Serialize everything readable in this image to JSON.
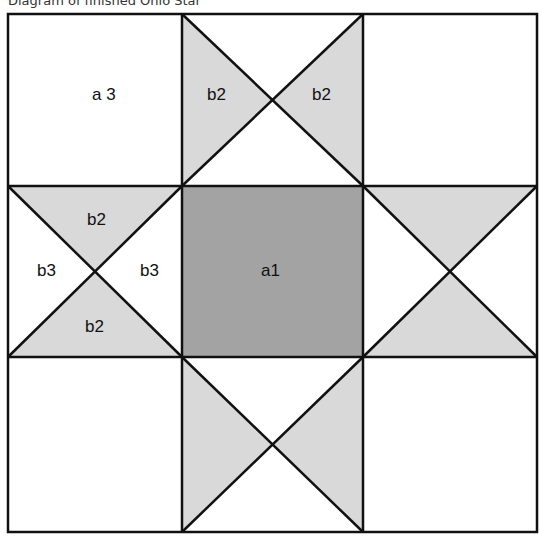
{
  "title": "Diagram of finished Ohio Star",
  "colors": {
    "light": "#d9d9d9",
    "dark": "#a3a3a3",
    "line": "#111111",
    "background": "#ffffff"
  },
  "labels": {
    "corner_tl": "a 3",
    "top_left_tri": "b2",
    "top_right_tri": "b2",
    "left_top_tri": "b2",
    "left_left_tri": "b3",
    "left_right_tri": "b3",
    "left_bottom_tri": "b2",
    "center": "a1"
  }
}
